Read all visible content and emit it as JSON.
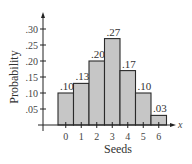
{
  "chart_data": {
    "type": "bar",
    "title": "",
    "xlabel": "Seeds",
    "ylabel": "Probability",
    "x_axis_variable": "x",
    "categories": [
      "0",
      "1",
      "2",
      "3",
      "4",
      "5",
      "6"
    ],
    "values": [
      0.1,
      0.13,
      0.2,
      0.27,
      0.17,
      0.1,
      0.03
    ],
    "data_labels": [
      ".10",
      ".13",
      ".20",
      ".27",
      ".17",
      ".10",
      ".03"
    ],
    "y_ticks": [
      0.05,
      0.1,
      0.15,
      0.2,
      0.25,
      0.3
    ],
    "y_tick_labels": [
      ".05",
      ".10",
      ".15",
      ".20",
      ".25",
      ".30"
    ],
    "ylim": [
      0,
      0.32
    ],
    "grid": false,
    "legend": null,
    "bar_style": "histogram (adjacent bars)",
    "bar_color": "#c6c6c6",
    "bar_outline": "#2a2a2a"
  }
}
